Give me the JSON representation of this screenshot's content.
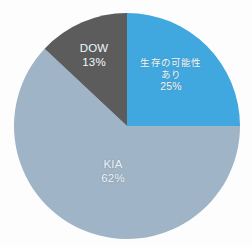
{
  "chart_data": {
    "type": "pie",
    "title": "",
    "subtitle": "",
    "xlabel": "",
    "ylabel": "",
    "legend_position": "none",
    "grid": false,
    "labels_inside_slices": true,
    "start_angle_deg": 0,
    "direction": "clockwise",
    "categories": [
      "生存の可能性あり",
      "KIA",
      "DOW"
    ],
    "values": [
      25,
      62,
      13
    ],
    "value_unit": "percent",
    "slices": [
      {
        "name": "survival-possible",
        "label_lines": [
          "生存の可能性",
          "あり"
        ],
        "percent_text": "25%",
        "value": 25,
        "color": "#3fa8df",
        "start_deg": 0,
        "end_deg": 90
      },
      {
        "name": "kia",
        "label_lines": [
          "KIA"
        ],
        "percent_text": "62%",
        "value": 62,
        "color": "#9fb4c6",
        "start_deg": 90,
        "end_deg": 313.2
      },
      {
        "name": "dow",
        "label_lines": [
          "DOW"
        ],
        "percent_text": "13%",
        "value": 13,
        "color": "#5c5c5c",
        "start_deg": 313.2,
        "end_deg": 360
      }
    ]
  },
  "figure": {
    "background_color": "#fdfdfd",
    "label_text_color": "#f2f6f8",
    "center_x": 127,
    "center_y": 126,
    "radius": 113
  },
  "labels": {
    "survival": {
      "line1": "生存の可能性",
      "line2": "あり",
      "percent": "25%"
    },
    "dow": {
      "line1": "DOW",
      "percent": "13%"
    },
    "kia": {
      "line1": "KIA",
      "percent": "62%"
    }
  }
}
